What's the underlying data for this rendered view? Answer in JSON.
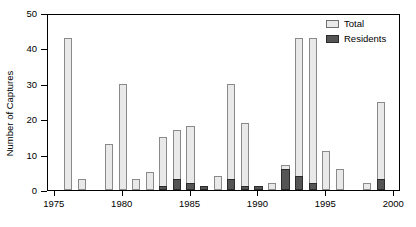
{
  "chart_data": {
    "type": "bar",
    "title": "",
    "subtitle": "",
    "xlabel": "",
    "ylabel": "Number of Captures",
    "xlim": [
      1974.5,
      2000.5
    ],
    "ylim": [
      0,
      50
    ],
    "ytick_labels": [
      "0",
      "10",
      "20",
      "30",
      "40",
      "50"
    ],
    "ytick_values": [
      0,
      10,
      20,
      30,
      40,
      50
    ],
    "xtick_labels": [
      "1975",
      "1980",
      "1985",
      "1990",
      "1995",
      "2000"
    ],
    "xtick_values": [
      1975,
      1980,
      1985,
      1990,
      1995,
      2000
    ],
    "grid": false,
    "legend_position": "top-right",
    "stacked": true,
    "categories": [
      1975,
      1976,
      1977,
      1978,
      1979,
      1980,
      1981,
      1982,
      1983,
      1984,
      1985,
      1986,
      1987,
      1988,
      1989,
      1990,
      1991,
      1992,
      1993,
      1994,
      1995,
      1996,
      1997,
      1998,
      1999,
      2000
    ],
    "series": [
      {
        "name": "Total",
        "color": "#e9e9e9",
        "values": [
          0,
          43,
          3,
          0,
          13,
          30,
          3,
          5,
          15,
          17,
          18,
          1,
          4,
          30,
          19,
          1,
          2,
          7,
          43,
          43,
          11,
          6,
          0,
          2,
          25,
          0
        ]
      },
      {
        "name": "Residents",
        "color": "#555555",
        "values": [
          0,
          0,
          0,
          0,
          0,
          0,
          0,
          0,
          1,
          3,
          2,
          1,
          0,
          3,
          1,
          1,
          0,
          6,
          4,
          2,
          0,
          0,
          0,
          0,
          3,
          0
        ]
      }
    ]
  },
  "legend": {
    "items": [
      {
        "label": "Total",
        "swatch": "light-gray-square"
      },
      {
        "label": "Residents",
        "swatch": "dark-gray-square"
      }
    ]
  }
}
